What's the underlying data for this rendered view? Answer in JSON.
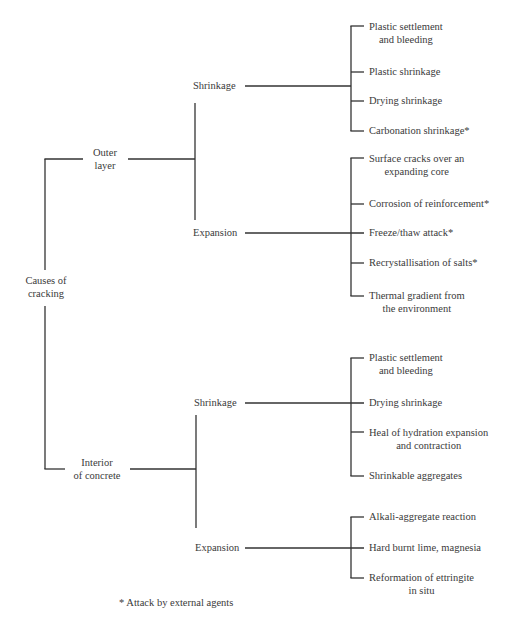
{
  "diagram": {
    "root": {
      "label_line1": "Causes of",
      "label_line2": "cracking"
    },
    "outer": {
      "label_line1": "Outer",
      "label_line2": "layer",
      "shrinkage": {
        "label": "Shrinkage",
        "items": [
          {
            "line1": "Plastic settlement",
            "line2": "and bleeding"
          },
          {
            "line1": "Plastic shrinkage"
          },
          {
            "line1": "Drying shrinkage"
          },
          {
            "line1": "Carbonation shrinkage*"
          }
        ]
      },
      "expansion": {
        "label": "Expansion",
        "items": [
          {
            "line1": "Surface cracks over an",
            "line2": "expanding core"
          },
          {
            "line1": "Corrosion of reinforcement*"
          },
          {
            "line1": "Freeze/thaw attack*"
          },
          {
            "line1": "Recrystallisation of salts*"
          },
          {
            "line1": "Thermal gradient from",
            "line2": "the environment"
          }
        ]
      }
    },
    "interior": {
      "label_line1": "Interior",
      "label_line2": "of concrete",
      "shrinkage": {
        "label": "Shrinkage",
        "items": [
          {
            "line1": "Plastic settlement",
            "line2": "and bleeding"
          },
          {
            "line1": "Drying shrinkage"
          },
          {
            "line1": "Heal of hydration expansion",
            "line2": "and contraction"
          },
          {
            "line1": "Shrinkable aggregates"
          }
        ]
      },
      "expansion": {
        "label": "Expansion",
        "items": [
          {
            "line1": "Alkali-aggregate reaction"
          },
          {
            "line1": "Hard burnt lime, magnesia"
          },
          {
            "line1": "Reformation of ettringite",
            "line2": "in situ"
          }
        ]
      }
    },
    "footnote": "* Attack by external agents"
  }
}
